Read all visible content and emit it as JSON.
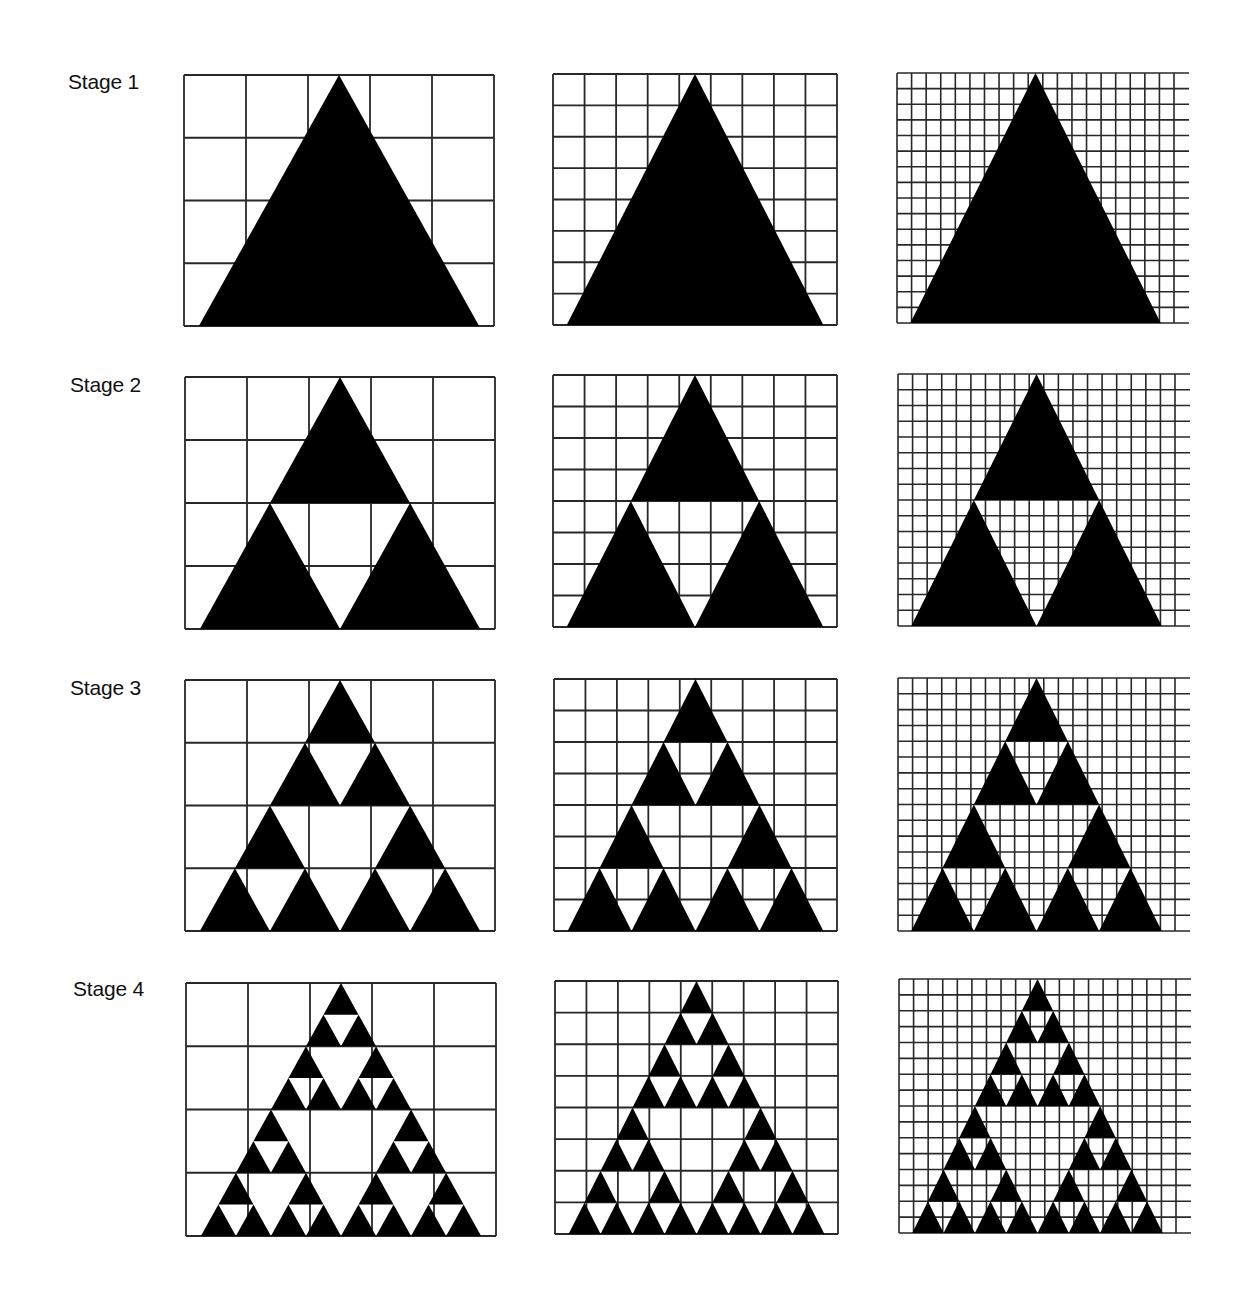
{
  "figure": {
    "colors": {
      "fill": "#000000",
      "grid": "#111111",
      "background": "#ffffff"
    },
    "grid_columns": [
      {
        "id": "coarse",
        "cols": 5,
        "rows": 4,
        "open_right": false
      },
      {
        "id": "medium",
        "cols": 9,
        "rows": 8,
        "open_right": false
      },
      {
        "id": "fine",
        "cols": 19,
        "rows": 16,
        "open_right": true
      }
    ],
    "stages": [
      {
        "label": "Stage 1",
        "depth": 0
      },
      {
        "label": "Stage 2",
        "depth": 1
      },
      {
        "label": "Stage 3",
        "depth": 2
      },
      {
        "label": "Stage 4",
        "depth": 3
      }
    ]
  }
}
